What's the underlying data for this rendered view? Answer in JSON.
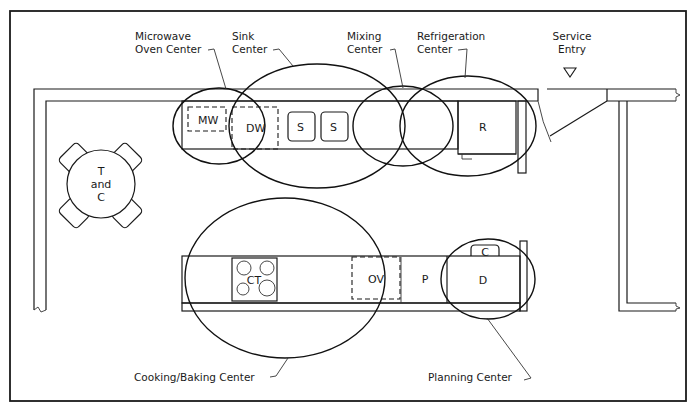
{
  "diagram": {
    "type": "kitchen floor plan",
    "center_labels": {
      "microwave": [
        "Microwave",
        "Oven Center"
      ],
      "sink": [
        "Sink",
        "Center"
      ],
      "mixing": [
        "Mixing",
        "Center"
      ],
      "refrigeration": [
        "Refrigeration",
        "Center"
      ],
      "service": [
        "Service",
        "Entry"
      ],
      "cooking": "Cooking/Baking Center",
      "planning": "Planning Center"
    },
    "appliances": {
      "microwave": "MW",
      "dishwasher": "DW",
      "sink_left": "S",
      "sink_right": "S",
      "refrigerator": "R",
      "cooktop": "CT",
      "oven": "OV",
      "pantry": "P",
      "desk": "D",
      "chair": "C",
      "table": [
        "T",
        "and",
        "C"
      ]
    }
  }
}
